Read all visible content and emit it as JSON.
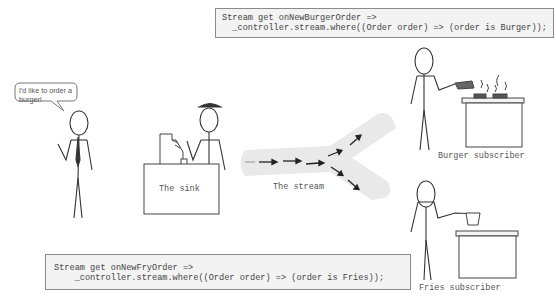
{
  "customer": {
    "speech": "I'd like to order a burger!"
  },
  "sink": {
    "label": "The sink"
  },
  "stream": {
    "label": "The stream"
  },
  "burger_subscriber": {
    "label": "Burger subscriber",
    "code_line1": "Stream get onNewBurgerOrder =>",
    "code_line2": "  _controller.stream.where((Order order) => (order is Burger));"
  },
  "fries_subscriber": {
    "label": "Fries subscriber",
    "code_line1": "Stream get onNewFryOrder =>",
    "code_line2": "    _controller.stream.where((Order order) => (order is Fries));"
  },
  "colors": {
    "line": "#333333",
    "stream_band": "#e8e8e8",
    "code_bg": "#f3f3f3"
  }
}
